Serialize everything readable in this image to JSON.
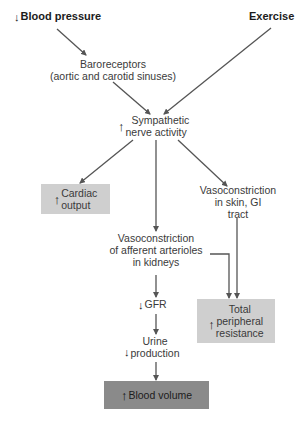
{
  "nodes": {
    "blood_pressure": {
      "direction": "down",
      "label": "Blood pressure"
    },
    "exercise": {
      "label": "Exercise"
    },
    "baroreceptors": {
      "line1": "Baroreceptors",
      "line2": "(aortic and carotid sinuses)"
    },
    "sympathetic": {
      "direction": "up",
      "line1": "Sympathetic",
      "line2": "nerve activity"
    },
    "cardiac_output": {
      "direction": "up",
      "line1": "Cardiac",
      "line2": "output"
    },
    "vaso_skin": {
      "line1": "Vasoconstriction",
      "line2": "in skin, GI",
      "line3": "tract"
    },
    "vaso_kidney": {
      "line1": "Vasoconstriction",
      "line2": "of afferent arterioles",
      "line3": "in kidneys"
    },
    "gfr": {
      "direction": "down",
      "label": "GFR"
    },
    "urine": {
      "direction": "down",
      "line1": "Urine",
      "line2": "production"
    },
    "tpr": {
      "direction": "up",
      "line1": "Total",
      "line2": "peripheral",
      "line3": "resistance"
    },
    "blood_volume": {
      "direction": "up",
      "label": "Blood volume"
    }
  },
  "edges": [
    {
      "from": "blood_pressure",
      "to": "baroreceptors"
    },
    {
      "from": "baroreceptors",
      "to": "sympathetic"
    },
    {
      "from": "exercise",
      "to": "sympathetic"
    },
    {
      "from": "sympathetic",
      "to": "cardiac_output"
    },
    {
      "from": "sympathetic",
      "to": "vaso_kidney"
    },
    {
      "from": "sympathetic",
      "to": "vaso_skin"
    },
    {
      "from": "vaso_skin",
      "to": "tpr"
    },
    {
      "from": "vaso_kidney",
      "to": "tpr"
    },
    {
      "from": "vaso_kidney",
      "to": "gfr"
    },
    {
      "from": "gfr",
      "to": "urine"
    },
    {
      "from": "urine",
      "to": "blood_volume"
    }
  ],
  "colors": {
    "line": "#555555",
    "box_light": "#cfcfcf",
    "box_dark": "#8a8a8a"
  },
  "glyphs": {
    "up": "↑",
    "down": "↓"
  }
}
